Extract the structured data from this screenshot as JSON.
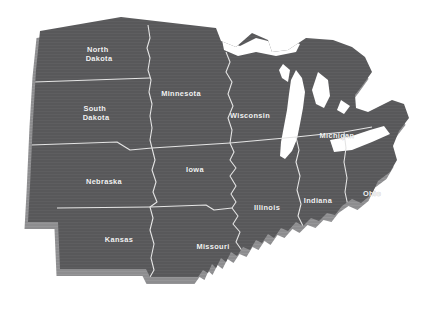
{
  "map": {
    "title": "Midwest United States Map",
    "background_color": "#ffffff",
    "land_fill": "#58585a",
    "extrude_fill": "#8d8d8f",
    "border_color": "#e4e4e4",
    "label_color": "#f2f2f2",
    "water_fill": "#ffffff",
    "projection_note": "slightly rotated plan view with 3-D extruded edge",
    "states": [
      {
        "id": "north-dakota",
        "label": "North Dakota",
        "lines": [
          "North",
          "Dakota"
        ],
        "label_x": 99,
        "label_y": 52
      },
      {
        "id": "south-dakota",
        "label": "South Dakota",
        "lines": [
          "South",
          "Dakota"
        ],
        "label_x": 96,
        "label_y": 111
      },
      {
        "id": "nebraska",
        "label": "Nebraska",
        "lines": [
          "Nebraska"
        ],
        "label_x": 104,
        "label_y": 184
      },
      {
        "id": "kansas",
        "label": "Kansas",
        "lines": [
          "Kansas"
        ],
        "label_x": 119,
        "label_y": 242
      },
      {
        "id": "minnesota",
        "label": "Minnesota",
        "lines": [
          "Minnesota"
        ],
        "label_x": 181,
        "label_y": 96
      },
      {
        "id": "iowa",
        "label": "Iowa",
        "lines": [
          "Iowa"
        ],
        "label_x": 195,
        "label_y": 172
      },
      {
        "id": "missouri",
        "label": "Missouri",
        "lines": [
          "Missouri"
        ],
        "label_x": 213,
        "label_y": 249
      },
      {
        "id": "wisconsin",
        "label": "Wisconsin",
        "lines": [
          "Wisconsin"
        ],
        "label_x": 250,
        "label_y": 118
      },
      {
        "id": "illinois",
        "label": "Illinois",
        "lines": [
          "Illinois"
        ],
        "label_x": 267,
        "label_y": 210
      },
      {
        "id": "indiana",
        "label": "Indiana",
        "lines": [
          "Indiana"
        ],
        "label_x": 318,
        "label_y": 203
      },
      {
        "id": "michigan",
        "label": "Michigan",
        "lines": [
          "Michigan"
        ],
        "label_x": 337,
        "label_y": 138
      },
      {
        "id": "ohio",
        "label": "Ohio",
        "lines": [
          "Ohio"
        ],
        "label_x": 372,
        "label_y": 196
      }
    ]
  }
}
